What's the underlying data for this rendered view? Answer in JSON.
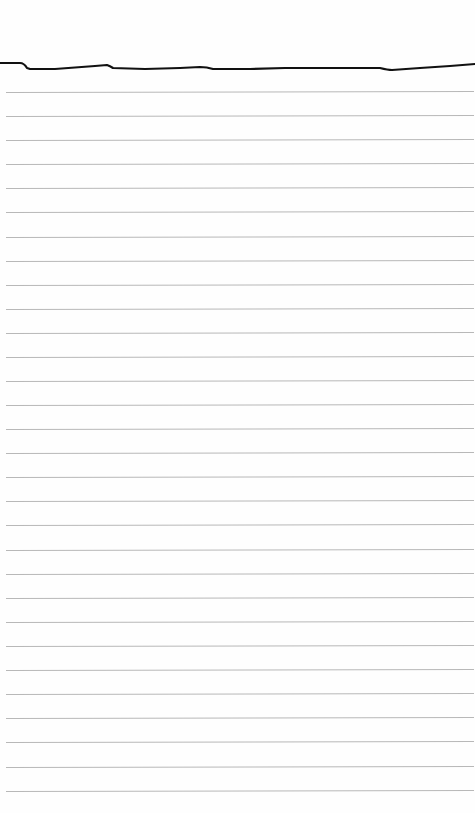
{
  "page": {
    "type": "lined-paper",
    "background_color": "#fefefe",
    "line_color": "#b8b8b8",
    "edge_stroke_color": "#111111",
    "line_count": 30,
    "line_spacing_px": 24.2,
    "first_line_y": 92,
    "lines_y": [
      92,
      116,
      140,
      164,
      188,
      212,
      237,
      261,
      285,
      309,
      333,
      357,
      381,
      405,
      429,
      453,
      477,
      501,
      525,
      550,
      574,
      598,
      622,
      646,
      670,
      694,
      718,
      742,
      767,
      791
    ]
  }
}
